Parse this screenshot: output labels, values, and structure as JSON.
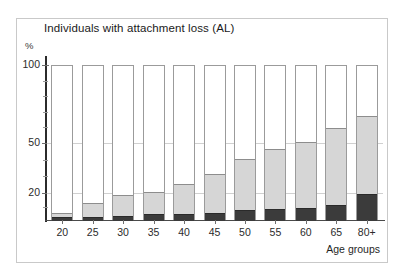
{
  "chart_data": {
    "type": "bar",
    "title": "Individuals with attachment loss (AL)",
    "xlabel": "Age groups",
    "ylabel": "%",
    "stacked": true,
    "grid": true,
    "legend_position": "none",
    "yticks": [
      100,
      50,
      20
    ],
    "ytick_labels": [
      "100",
      "50",
      "20"
    ],
    "ylim": [
      0,
      100
    ],
    "y_scale": "compressed",
    "categories": [
      "20",
      "25",
      "30",
      "35",
      "40",
      "45",
      "50",
      "55",
      "60",
      "65",
      "80+"
    ],
    "series": [
      {
        "name": "severe-AL",
        "color": "#3b3b3b",
        "values": [
          3,
          3,
          4,
          5,
          5,
          6,
          8,
          9,
          10,
          12,
          20
        ]
      },
      {
        "name": "moderate-AL",
        "color": "#d6d6d6",
        "values": [
          6,
          13,
          19,
          21,
          26,
          32,
          41,
          47,
          51,
          60,
          68
        ]
      },
      {
        "name": "no-AL",
        "color": "#ffffff",
        "values": [
          100,
          100,
          100,
          100,
          100,
          100,
          100,
          100,
          100,
          100,
          100
        ]
      }
    ]
  },
  "axes": {
    "y_unit": "%",
    "x_caption": "Age groups"
  }
}
